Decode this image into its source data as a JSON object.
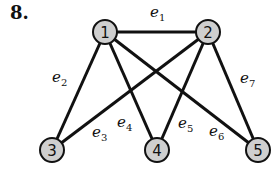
{
  "problem_number": "8.",
  "nodes": [
    {
      "id": "1",
      "label": "1",
      "x": 105,
      "y": 32
    },
    {
      "id": "2",
      "label": "2",
      "x": 208,
      "y": 32
    },
    {
      "id": "3",
      "label": "3",
      "x": 52,
      "y": 150
    },
    {
      "id": "4",
      "label": "4",
      "x": 157,
      "y": 150
    },
    {
      "id": "5",
      "label": "5",
      "x": 258,
      "y": 150
    }
  ],
  "edges": [
    {
      "id": "e1",
      "base": "e",
      "sub": "1",
      "from": "1",
      "to": "2",
      "lx": 150,
      "ly": 17
    },
    {
      "id": "e2",
      "base": "e",
      "sub": "2",
      "from": "1",
      "to": "3",
      "lx": 52,
      "ly": 82
    },
    {
      "id": "e3",
      "base": "e",
      "sub": "3",
      "from": "2",
      "to": "3",
      "lx": 92,
      "ly": 137
    },
    {
      "id": "e4",
      "base": "e",
      "sub": "4",
      "from": "1",
      "to": "4",
      "lx": 117,
      "ly": 127
    },
    {
      "id": "e5",
      "base": "e",
      "sub": "5",
      "from": "2",
      "to": "4",
      "lx": 178,
      "ly": 128
    },
    {
      "id": "e6",
      "base": "e",
      "sub": "6",
      "from": "1",
      "to": "5",
      "lx": 209,
      "ly": 136
    },
    {
      "id": "e7",
      "base": "e",
      "sub": "7",
      "from": "2",
      "to": "5",
      "lx": 240,
      "ly": 83
    }
  ],
  "colors": {
    "node_fill": "#cfcfcf",
    "stroke": "#111111"
  }
}
